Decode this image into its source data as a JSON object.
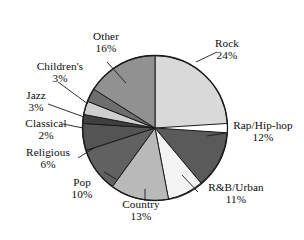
{
  "chart_data": {
    "type": "pie",
    "title": "",
    "subtitle": "",
    "xlabel": "",
    "ylabel": "",
    "legend_position": "none",
    "grid": false,
    "labels_show_percent": true,
    "categories": [
      "Rock",
      "Rap/Hip-hop",
      "R&B/Urban",
      "Country",
      "Pop",
      "Religious",
      "Classical",
      "Jazz",
      "Children's",
      "Other"
    ],
    "values": [
      24,
      12,
      11,
      13,
      10,
      6,
      2,
      3,
      3,
      16
    ],
    "slices": [
      {
        "name": "Rock",
        "percent": 24,
        "percent_text": "24%",
        "color": "#d9d9d9",
        "start_angle": 0,
        "end_angle": 86.4,
        "label_line": true
      },
      {
        "name": "Rap/Hip-hop",
        "percent": 12,
        "percent_text": "12%",
        "color": "#5a5a5a",
        "start_angle": 86.4,
        "end_angle": 129.6,
        "label_line": true
      },
      {
        "name": "R&B/Urban",
        "percent": 11,
        "percent_text": "11%",
        "color": "#f3f3f3",
        "start_angle": 129.6,
        "end_angle": 169.2,
        "label_line": true
      },
      {
        "name": "Country",
        "percent": 13,
        "percent_text": "13%",
        "color": "#b9b9b9",
        "start_angle": 169.2,
        "end_angle": 216.0,
        "label_line": true
      },
      {
        "name": "Pop",
        "percent": 10,
        "percent_text": "10%",
        "color": "#616161",
        "start_angle": 216.0,
        "end_angle": 252.0,
        "label_line": true
      },
      {
        "name": "Religious",
        "percent": 6,
        "percent_text": "6%",
        "color": "#545454",
        "start_angle": 252.0,
        "end_angle": 273.6,
        "label_line": true
      },
      {
        "name": "Classical",
        "percent": 2,
        "percent_text": "2%",
        "color": "#3f3f3f",
        "start_angle": 273.6,
        "end_angle": 280.8,
        "label_line": true
      },
      {
        "name": "Jazz",
        "percent": 3,
        "percent_text": "3%",
        "color": "#cfcfcf",
        "start_angle": 280.8,
        "end_angle": 291.6,
        "label_line": true
      },
      {
        "name": "Children's",
        "percent": 3,
        "percent_text": "3%",
        "color": "#6e6e6e",
        "start_angle": 291.6,
        "end_angle": 302.4,
        "label_line": true
      },
      {
        "name": "Other",
        "percent": 16,
        "percent_text": "16%",
        "color": "#919191",
        "start_angle": 302.4,
        "end_angle": 360.0,
        "label_line": true
      }
    ],
    "total_percent": 100,
    "units": "percent",
    "outline_color": "#1a1a1a",
    "background": "#ffffff"
  },
  "labels": {
    "rock": {
      "name": "Rock",
      "pct": "24%"
    },
    "rap": {
      "name": "Rap/Hip-hop",
      "pct": "12%"
    },
    "rnb": {
      "name": "R&B/Urban",
      "pct": "11%"
    },
    "country": {
      "name": "Country",
      "pct": "13%"
    },
    "pop": {
      "name": "Pop",
      "pct": "10%"
    },
    "religious": {
      "name": "Religious",
      "pct": "6%"
    },
    "classical": {
      "name": "Classical",
      "pct": "2%"
    },
    "jazz": {
      "name": "Jazz",
      "pct": "3%"
    },
    "childrens": {
      "name": "Children's",
      "pct": "3%"
    },
    "other": {
      "name": "Other",
      "pct": "16%"
    }
  }
}
